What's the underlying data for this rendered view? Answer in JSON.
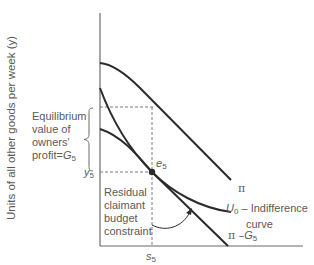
{
  "diagram": {
    "y_axis_label": "Units of all other goods per week (y)",
    "annotations": {
      "equilibrium_line1": "Equilibrium",
      "equilibrium_line2": "value of",
      "equilibrium_line3": "owners'",
      "equilibrium_line4": "profit=",
      "equilibrium_var": "G",
      "equilibrium_sub": "5",
      "y5_var": "y",
      "y5_sub": "5",
      "s5_var": "s",
      "s5_sub": "5",
      "e5_var": "e",
      "e5_sub": "5",
      "residual_line1": "Residual",
      "residual_line2": "claimant",
      "residual_line3": "budget",
      "residual_line4": "constraint",
      "pi_label": "π",
      "u0_var": "U",
      "u0_sub": "0",
      "u0_text": " – Indifference",
      "u0_text2": "curve",
      "pi_minus_g_prefix": "π –",
      "pi_minus_g_var": "G",
      "pi_minus_g_sub": "5"
    },
    "curves": [
      {
        "name": "π",
        "type": "concave curve"
      },
      {
        "name": "π – G5",
        "type": "budget constraint line"
      },
      {
        "name": "U0",
        "type": "indifference curve"
      }
    ],
    "colors": {
      "curve": "#2b2b2b",
      "axis": "#6b6b6b",
      "dashed": "#7a7a7a",
      "text": "#5a5a5a"
    }
  }
}
